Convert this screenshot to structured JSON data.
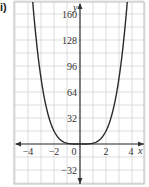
{
  "label": "i)",
  "chart_data": {
    "type": "line",
    "title": "",
    "xlabel": "x",
    "ylabel": "y",
    "xlim": [
      -5,
      5
    ],
    "ylim": [
      -48,
      176
    ],
    "grid": true,
    "x_ticks": [
      -4,
      -2,
      0,
      2,
      4
    ],
    "y_ticks": [
      -32,
      32,
      64,
      96,
      128,
      160
    ],
    "x_tick_labels": [
      "−4",
      "−2",
      "0",
      "2",
      "4"
    ],
    "y_tick_labels": [
      "−32",
      "32",
      "64",
      "96",
      "128",
      "160"
    ],
    "series": [
      {
        "name": "y = x^4 (shape; flat near origin)",
        "x": [
          -3.7,
          -3.5,
          -3,
          -2.5,
          -2,
          -1.5,
          -1,
          0,
          1,
          1.5,
          2,
          2.5,
          3,
          3.5,
          3.7
        ],
        "y": [
          176,
          150,
          81,
          39,
          16,
          5,
          1,
          0,
          1,
          5,
          16,
          39,
          81,
          150,
          176
        ]
      }
    ],
    "legend": null
  }
}
